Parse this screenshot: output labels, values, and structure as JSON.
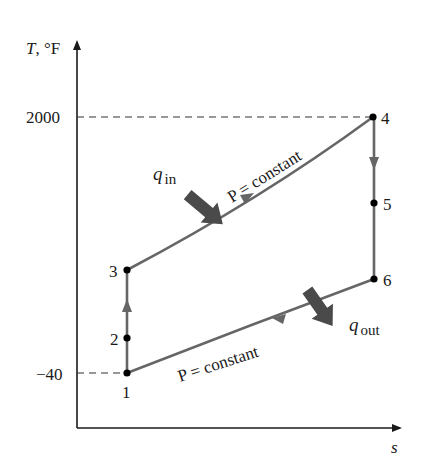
{
  "diagram": {
    "axes": {
      "y_label_var": "T",
      "y_label_unit": ", °F",
      "x_label": "s",
      "y_ticks": [
        {
          "label": "2000",
          "value": 2000
        },
        {
          "label": "−40",
          "value": -40
        }
      ]
    },
    "points": [
      {
        "id": "1",
        "label": "1"
      },
      {
        "id": "2",
        "label": "2"
      },
      {
        "id": "3",
        "label": "3"
      },
      {
        "id": "4",
        "label": "4"
      },
      {
        "id": "5",
        "label": "5"
      },
      {
        "id": "6",
        "label": "6"
      }
    ],
    "process_labels": {
      "upper": "P = constant",
      "lower": "P = constant"
    },
    "heat": {
      "in_var": "q",
      "in_sub": "in",
      "out_var": "q",
      "out_sub": "out"
    },
    "colors": {
      "axis": "#1a1a1a",
      "process_line": "#666666",
      "heat_arrow": "#4a4a4a",
      "point": "#000000"
    }
  }
}
